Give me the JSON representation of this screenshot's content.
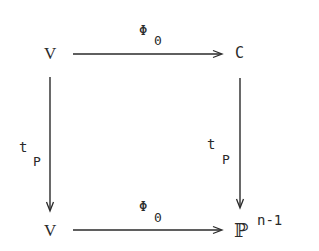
{
  "diagram": {
    "type": "commutative-square",
    "nodes": {
      "top_left": "V",
      "top_right": "C",
      "bottom_left": "V",
      "bottom_right_base": "ℙ",
      "bottom_right_superscript": "n-1"
    },
    "arrows": {
      "top": {
        "from": "V",
        "to": "C",
        "label": "Φ",
        "label_subscript": "0"
      },
      "bottom": {
        "from": "V",
        "to": "ℙ^(n-1)",
        "label": "Φ",
        "label_subscript": "0"
      },
      "left": {
        "from": "V",
        "to": "V",
        "label": "t",
        "label_subscript": "P"
      },
      "right": {
        "from": "C",
        "to": "ℙ^(n-1)",
        "label": "t",
        "label_subscript": "P"
      }
    },
    "colors": {
      "ink": "#2a2a2a",
      "background": "#ffffff"
    }
  }
}
